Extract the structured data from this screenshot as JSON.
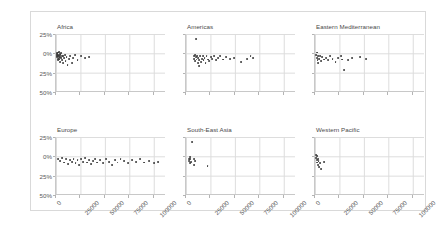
{
  "chart_data": {
    "type": "scatter",
    "title": "",
    "xlabel": "",
    "ylabel": "",
    "xlim": [
      0,
      112500
    ],
    "ylim": [
      -50,
      25
    ],
    "grid": true,
    "legend": null,
    "layout": {
      "rows": 2,
      "cols": 3,
      "shared_x": true,
      "shared_y": true
    },
    "yticks": [
      25,
      0,
      -25,
      -50
    ],
    "ytick_labels": [
      "25%",
      "0%",
      "25%",
      "50%"
    ],
    "xticks": [
      0,
      25000,
      50000,
      75000,
      100000
    ],
    "xtick_labels": [
      "0",
      "25000",
      "50000",
      "75000",
      "100000"
    ],
    "panels": [
      {
        "title": "Africa",
        "row": 0,
        "col": 0,
        "points": [
          {
            "x": 700,
            "y": -1
          },
          {
            "x": 900,
            "y": -3
          },
          {
            "x": 1100,
            "y": 0
          },
          {
            "x": 1300,
            "y": -5
          },
          {
            "x": 1500,
            "y": -2
          },
          {
            "x": 1700,
            "y": -7
          },
          {
            "x": 1900,
            "y": 1
          },
          {
            "x": 2100,
            "y": -4
          },
          {
            "x": 2300,
            "y": -9
          },
          {
            "x": 2500,
            "y": -2
          },
          {
            "x": 2700,
            "y": -6
          },
          {
            "x": 2900,
            "y": 2
          },
          {
            "x": 3100,
            "y": -3
          },
          {
            "x": 3400,
            "y": -8
          },
          {
            "x": 3700,
            "y": -1
          },
          {
            "x": 4000,
            "y": -5
          },
          {
            "x": 4300,
            "y": -11
          },
          {
            "x": 4600,
            "y": -2
          },
          {
            "x": 5000,
            "y": -6
          },
          {
            "x": 5400,
            "y": 0
          },
          {
            "x": 5900,
            "y": -4
          },
          {
            "x": 6400,
            "y": -9
          },
          {
            "x": 7000,
            "y": -3
          },
          {
            "x": 7600,
            "y": -13
          },
          {
            "x": 8300,
            "y": -6
          },
          {
            "x": 9000,
            "y": -2
          },
          {
            "x": 9800,
            "y": -10
          },
          {
            "x": 10800,
            "y": -5
          },
          {
            "x": 11800,
            "y": -15
          },
          {
            "x": 13000,
            "y": -7
          },
          {
            "x": 14500,
            "y": -3
          },
          {
            "x": 16000,
            "y": -12
          },
          {
            "x": 17500,
            "y": -6
          },
          {
            "x": 19500,
            "y": -2
          },
          {
            "x": 22000,
            "y": -9
          },
          {
            "x": 26000,
            "y": -4
          },
          {
            "x": 30000,
            "y": -6
          },
          {
            "x": 34000,
            "y": -5
          }
        ]
      },
      {
        "title": "Americas",
        "row": 0,
        "col": 1,
        "points": [
          {
            "x": 10000,
            "y": 19
          },
          {
            "x": 8000,
            "y": -4
          },
          {
            "x": 8500,
            "y": -7
          },
          {
            "x": 9000,
            "y": -2
          },
          {
            "x": 9500,
            "y": -10
          },
          {
            "x": 10200,
            "y": -5
          },
          {
            "x": 10800,
            "y": -8
          },
          {
            "x": 11400,
            "y": -3
          },
          {
            "x": 12000,
            "y": -12
          },
          {
            "x": 12600,
            "y": -6
          },
          {
            "x": 13200,
            "y": -16
          },
          {
            "x": 13800,
            "y": -9
          },
          {
            "x": 14500,
            "y": -4
          },
          {
            "x": 15200,
            "y": -11
          },
          {
            "x": 16000,
            "y": -7
          },
          {
            "x": 17000,
            "y": -3
          },
          {
            "x": 18000,
            "y": -9
          },
          {
            "x": 19000,
            "y": -6
          },
          {
            "x": 20000,
            "y": -12
          },
          {
            "x": 21000,
            "y": -4
          },
          {
            "x": 22500,
            "y": -8
          },
          {
            "x": 24000,
            "y": -10
          },
          {
            "x": 25500,
            "y": -5
          },
          {
            "x": 27000,
            "y": -7
          },
          {
            "x": 29000,
            "y": -3
          },
          {
            "x": 31000,
            "y": -9
          },
          {
            "x": 33000,
            "y": -6
          },
          {
            "x": 35000,
            "y": -4
          },
          {
            "x": 38000,
            "y": -8
          },
          {
            "x": 41000,
            "y": -5
          },
          {
            "x": 45000,
            "y": -7
          },
          {
            "x": 49000,
            "y": -6
          },
          {
            "x": 56000,
            "y": -11
          },
          {
            "x": 62000,
            "y": -7
          },
          {
            "x": 66000,
            "y": -4
          },
          {
            "x": 69000,
            "y": -6
          }
        ]
      },
      {
        "title": "Eastern Mediterranean",
        "row": 0,
        "col": 2,
        "points": [
          {
            "x": 1500,
            "y": -2
          },
          {
            "x": 1800,
            "y": -6
          },
          {
            "x": 2200,
            "y": 1
          },
          {
            "x": 2600,
            "y": -9
          },
          {
            "x": 3000,
            "y": -4
          },
          {
            "x": 3500,
            "y": -12
          },
          {
            "x": 4200,
            "y": -7
          },
          {
            "x": 5000,
            "y": -3
          },
          {
            "x": 6000,
            "y": -10
          },
          {
            "x": 7500,
            "y": -5
          },
          {
            "x": 9000,
            "y": -8
          },
          {
            "x": 11000,
            "y": -6
          },
          {
            "x": 13000,
            "y": -9
          },
          {
            "x": 15000,
            "y": -4
          },
          {
            "x": 18000,
            "y": -7
          },
          {
            "x": 21000,
            "y": -11
          },
          {
            "x": 24000,
            "y": -6
          },
          {
            "x": 27000,
            "y": -3
          },
          {
            "x": 28000,
            "y": -8
          },
          {
            "x": 30000,
            "y": -22
          },
          {
            "x": 34000,
            "y": -9
          },
          {
            "x": 38000,
            "y": -6
          },
          {
            "x": 46000,
            "y": -5
          },
          {
            "x": 52000,
            "y": -7
          }
        ]
      },
      {
        "title": "Europe",
        "row": 1,
        "col": 0,
        "points": [
          {
            "x": 2000,
            "y": -3
          },
          {
            "x": 4000,
            "y": -6
          },
          {
            "x": 6000,
            "y": -2
          },
          {
            "x": 8000,
            "y": -8
          },
          {
            "x": 10000,
            "y": -4
          },
          {
            "x": 12000,
            "y": -10
          },
          {
            "x": 14000,
            "y": -5
          },
          {
            "x": 16000,
            "y": -7
          },
          {
            "x": 18000,
            "y": -3
          },
          {
            "x": 20000,
            "y": -9
          },
          {
            "x": 22000,
            "y": -5
          },
          {
            "x": 24000,
            "y": -11
          },
          {
            "x": 26000,
            "y": -4
          },
          {
            "x": 28000,
            "y": -7
          },
          {
            "x": 30000,
            "y": -2
          },
          {
            "x": 32000,
            "y": -8
          },
          {
            "x": 34000,
            "y": -5
          },
          {
            "x": 36000,
            "y": -10
          },
          {
            "x": 38000,
            "y": -6
          },
          {
            "x": 40000,
            "y": -3
          },
          {
            "x": 42000,
            "y": -8
          },
          {
            "x": 45000,
            "y": -5
          },
          {
            "x": 48000,
            "y": -9
          },
          {
            "x": 51000,
            "y": -4
          },
          {
            "x": 54000,
            "y": -7
          },
          {
            "x": 57000,
            "y": -11
          },
          {
            "x": 60000,
            "y": -5
          },
          {
            "x": 63000,
            "y": -8
          },
          {
            "x": 66000,
            "y": -3
          },
          {
            "x": 70000,
            "y": -6
          },
          {
            "x": 74000,
            "y": -9
          },
          {
            "x": 78000,
            "y": -5
          },
          {
            "x": 82000,
            "y": -7
          },
          {
            "x": 86000,
            "y": -4
          },
          {
            "x": 90000,
            "y": -8
          },
          {
            "x": 95000,
            "y": -6
          },
          {
            "x": 100000,
            "y": -9
          },
          {
            "x": 104000,
            "y": -7
          }
        ]
      },
      {
        "title": "South-East Asia",
        "row": 1,
        "col": 1,
        "points": [
          {
            "x": 6000,
            "y": 19
          },
          {
            "x": 3000,
            "y": -3
          },
          {
            "x": 3400,
            "y": -6
          },
          {
            "x": 3800,
            "y": -1
          },
          {
            "x": 4200,
            "y": -9
          },
          {
            "x": 4600,
            "y": -4
          },
          {
            "x": 5200,
            "y": -7
          },
          {
            "x": 8000,
            "y": -4
          },
          {
            "x": 8500,
            "y": -11
          },
          {
            "x": 9500,
            "y": -6
          },
          {
            "x": 22000,
            "y": -12
          }
        ]
      },
      {
        "title": "Western Pacific",
        "row": 1,
        "col": 2,
        "points": [
          {
            "x": 1200,
            "y": 2
          },
          {
            "x": 1500,
            "y": -2
          },
          {
            "x": 1800,
            "y": -5
          },
          {
            "x": 2100,
            "y": 0
          },
          {
            "x": 2400,
            "y": -8
          },
          {
            "x": 2800,
            "y": -3
          },
          {
            "x": 3200,
            "y": -11
          },
          {
            "x": 3600,
            "y": -6
          },
          {
            "x": 4200,
            "y": -14
          },
          {
            "x": 5000,
            "y": -9
          },
          {
            "x": 6000,
            "y": -17
          },
          {
            "x": 9000,
            "y": -7
          }
        ]
      }
    ]
  }
}
